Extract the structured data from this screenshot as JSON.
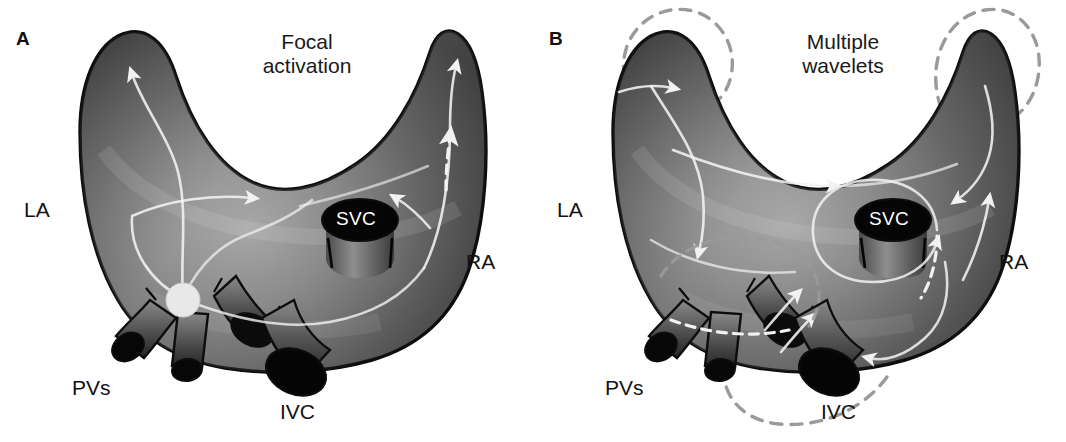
{
  "figure": {
    "background_color": "#ffffff",
    "width": 1066,
    "height": 442,
    "caption_style": "two-panel anatomical illustration of atrial fibrillation mechanisms"
  },
  "colors": {
    "tissue_dark": "#3d3d3d",
    "tissue_mid": "#6e6e6e",
    "tissue_light": "#a8a8a8",
    "outline": "#0d0d0d",
    "vessel_lumen": "#050505",
    "pathway_white": "#f2f2f2",
    "dashed_circuit_gray": "#9a9a9a",
    "focal_point": "#e8e8e8",
    "label_text": "#121212",
    "svc_text": "#ffffff"
  },
  "panels": [
    {
      "id": "A",
      "letter": "A",
      "title": "Focal\nactivation",
      "labels": {
        "la": "LA",
        "ra": "RA",
        "pvs": "PVs",
        "ivc": "IVC",
        "svc": "SVC"
      },
      "focal_point": {
        "present": true,
        "description": "single pale focal origin at left atrial / pulmonary vein junction",
        "cx": 183,
        "cy": 300,
        "r": 17
      },
      "conduction_pathways": 6,
      "solid_arrows": 5,
      "dashed_arrows": 1,
      "dashed_circuits": 0
    },
    {
      "id": "B",
      "letter": "B",
      "title": "Multiple\nwavelets",
      "labels": {
        "la": "LA",
        "ra": "RA",
        "pvs": "PVs",
        "ivc": "IVC",
        "svc": "SVC"
      },
      "focal_point": {
        "present": false,
        "description": "no single focal origin",
        "cx": 0,
        "cy": 0,
        "r": 0
      },
      "conduction_pathways": 9,
      "solid_arrows": 8,
      "dashed_arrows": 2,
      "dashed_circuits": 4,
      "dashed_circuit_locations": [
        "left atrial appendage (upper left)",
        "right atrial appendage (upper right)",
        "pulmonary vein region (lower left)",
        "inferior vena cava region (lower center)"
      ]
    }
  ]
}
